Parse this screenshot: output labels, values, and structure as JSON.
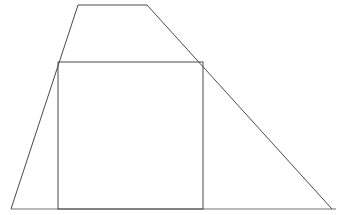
{
  "figure": {
    "background_color": "#ffffff",
    "width": 342,
    "height": 215,
    "stroke_color": "#4a4a4a",
    "baseline_color": "#b9b9b9",
    "stroke_width": "1",
    "baseline_width": "2",
    "fill": "none",
    "shapes": [
      {
        "name": "trapezoid",
        "type": "polygon",
        "points": "11,209 78,5 147,5 332,209",
        "closed": false,
        "stroke": "#4a4a4a",
        "stroke_width": "1"
      },
      {
        "name": "inner-rectangle",
        "type": "rect",
        "x": 58,
        "y": 62,
        "width": 145,
        "height": 147,
        "stroke": "#4a4a4a",
        "stroke_width": "1"
      },
      {
        "name": "baseline",
        "type": "line",
        "x1": 11,
        "y1": 209,
        "x2": 336,
        "y2": 209,
        "stroke": "#b9b9b9",
        "stroke_width": "2"
      }
    ],
    "vertices": {
      "trapezoid_bottom_left": "11,209",
      "trapezoid_top_left": "78,5",
      "trapezoid_top_right": "147,5",
      "trapezoid_bottom_right": "332,209",
      "rect_top_left": "58,62",
      "rect_top_right": "203,62",
      "rect_bottom_right": "203,209",
      "rect_bottom_left": "58,209"
    }
  }
}
